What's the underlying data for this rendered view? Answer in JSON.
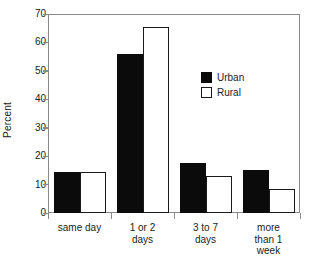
{
  "chart_data": {
    "type": "bar",
    "title": "",
    "subtitle": "",
    "xlabel": "",
    "ylabel": "Percent",
    "ylim": [
      0,
      70
    ],
    "yticks": [
      0,
      10,
      20,
      30,
      40,
      50,
      60,
      70
    ],
    "grid": false,
    "legend_position": "inner-right",
    "categories": [
      "same day",
      "1 or 2 days",
      "3 to 7 days",
      "more than 1 week"
    ],
    "category_lines": [
      [
        "same day"
      ],
      [
        "1 or 2",
        "days"
      ],
      [
        "3 to 7",
        "days"
      ],
      [
        "more",
        "than 1",
        "week"
      ]
    ],
    "series": [
      {
        "name": "Urban",
        "color": "#0b0b0b",
        "fill": "solid",
        "values": [
          14.5,
          56,
          17.5,
          15
        ]
      },
      {
        "name": "Rural",
        "color": "#ffffff",
        "fill": "outline",
        "values": [
          14.5,
          65.5,
          13,
          8.5
        ]
      }
    ]
  },
  "axis": {
    "frame_color": "#8a8a8a",
    "ylabel": "Percent"
  }
}
